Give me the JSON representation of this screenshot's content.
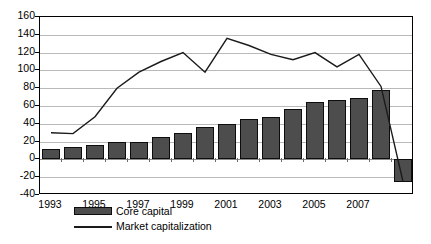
{
  "chart_data": {
    "type": "bar",
    "title": "",
    "xlabel": "",
    "ylabel": "",
    "ylim": [
      -40,
      160
    ],
    "yticks": [
      160,
      140,
      120,
      100,
      80,
      60,
      40,
      20,
      0,
      -20,
      -40
    ],
    "grid": true,
    "legend_position": "bottom-left",
    "categories": [
      "1993",
      "1994",
      "1995",
      "1996",
      "1997",
      "1998",
      "1999",
      "2000",
      "2001",
      "2002",
      "2003",
      "2004",
      "2005",
      "2006",
      "2007",
      "2008",
      "2009"
    ],
    "xtick_labels": [
      "1993",
      "1995",
      "1997",
      "1999",
      "2001",
      "2003",
      "2005",
      "2007"
    ],
    "series": [
      {
        "name": "Core capital",
        "type": "bar",
        "color": "#4d4d4d",
        "values": [
          12,
          14,
          16,
          19,
          20,
          25,
          30,
          36,
          40,
          45,
          48,
          57,
          64,
          67,
          69,
          78,
          -25
        ]
      },
      {
        "name": "Market capitalization",
        "type": "line",
        "color": "#1a1a1a",
        "values": [
          30,
          29,
          48,
          80,
          98,
          110,
          120,
          98,
          136,
          128,
          118,
          112,
          120,
          104,
          118,
          82,
          -25
        ]
      }
    ]
  },
  "legend": {
    "items": [
      {
        "label": "Core capital",
        "marker": "bar-swatch"
      },
      {
        "label": "Market capitalization",
        "marker": "line-swatch"
      }
    ]
  },
  "axis": {
    "y_labels": [
      "160",
      "140",
      "120",
      "100",
      "80",
      "60",
      "40",
      "20",
      "0",
      "-20",
      "-40"
    ],
    "x_labels": [
      "1993",
      "1995",
      "1997",
      "1999",
      "2001",
      "2003",
      "2005",
      "2007"
    ]
  }
}
